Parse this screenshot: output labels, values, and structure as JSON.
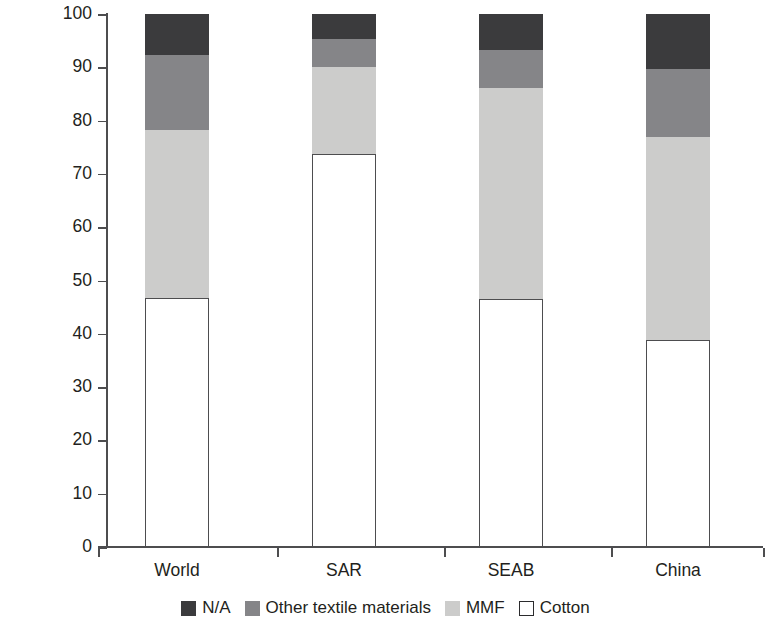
{
  "chart_data": {
    "type": "bar",
    "subtype": "stacked-vertical-100",
    "title": "",
    "xlabel": "",
    "ylabel": "Material share of apparel exports, 2012 (%)",
    "ylim": [
      0,
      100
    ],
    "yticks": [
      0,
      10,
      20,
      30,
      40,
      50,
      60,
      70,
      80,
      90,
      100
    ],
    "ytick_labels": [
      "0",
      "10",
      "20",
      "30",
      "40",
      "50",
      "60",
      "70",
      "80",
      "90",
      "100"
    ],
    "grid": false,
    "legend_position": "bottom",
    "categories": [
      "World",
      "SAR",
      "SEAB",
      "China"
    ],
    "stack_order_bottom_to_top": [
      "Cotton",
      "MMF",
      "Other textile materials",
      "N/A"
    ],
    "series": [
      {
        "name": "Cotton",
        "color": "#ffffff",
        "values": [
          46.7,
          73.7,
          46.6,
          38.8
        ]
      },
      {
        "name": "MMF",
        "color": "#cccccb",
        "values": [
          31.5,
          16.4,
          39.5,
          38.1
        ]
      },
      {
        "name": "Other textile materials",
        "color": "#858588",
        "values": [
          14.1,
          5.2,
          7.1,
          12.8
        ]
      },
      {
        "name": "N/A",
        "color": "#3b3b3d",
        "values": [
          7.7,
          4.7,
          6.8,
          10.3
        ]
      }
    ],
    "cumulative_tops": {
      "Cotton": [
        46.7,
        73.7,
        46.6,
        38.8
      ],
      "MMF": [
        78.2,
        90.1,
        86.1,
        76.9
      ],
      "Other textile materials": [
        92.3,
        95.3,
        93.2,
        89.7
      ],
      "N/A": [
        100,
        100,
        100,
        100
      ]
    },
    "legend": [
      {
        "label": "N/A",
        "color": "#3b3b3d"
      },
      {
        "label": "Other textile materials",
        "color": "#858588"
      },
      {
        "label": "MMF",
        "color": "#cccccb"
      },
      {
        "label": "Cotton",
        "color": "#ffffff"
      }
    ]
  }
}
